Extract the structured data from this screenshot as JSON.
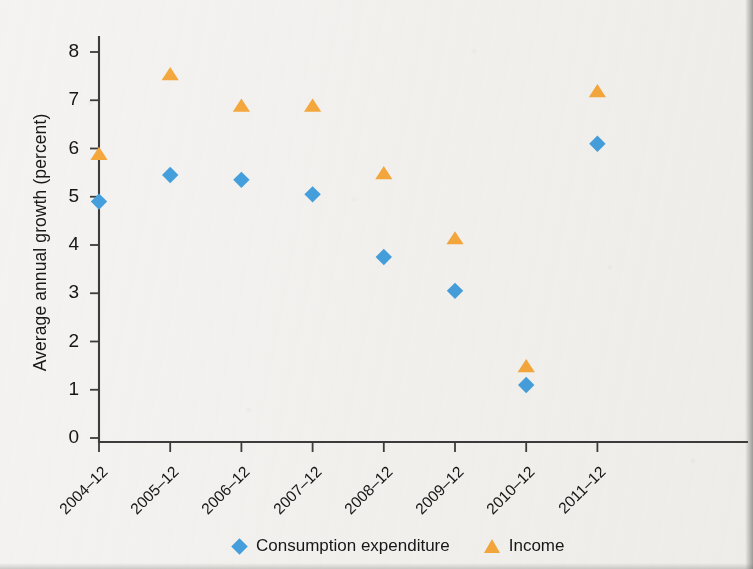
{
  "chart_data": {
    "type": "scatter",
    "title": "",
    "xlabel": "",
    "ylabel": "Average annual growth (percent)",
    "categories": [
      "2004–12",
      "2005–12",
      "2006–12",
      "2007–12",
      "2008–12",
      "2009–12",
      "2010–12",
      "2011–12"
    ],
    "ylim": [
      0,
      8
    ],
    "y_ticks": [
      0,
      1,
      2,
      3,
      4,
      5,
      6,
      7,
      8
    ],
    "y_tick_labels": [
      "0",
      "1",
      "2",
      "3",
      "4",
      "5",
      "6",
      "7",
      "8"
    ],
    "grid": false,
    "legend_position": "bottom",
    "series": [
      {
        "name": "Consumption expenditure",
        "marker": "diamond",
        "color": "#45a0de",
        "values": [
          4.9,
          5.45,
          5.35,
          5.05,
          3.75,
          3.05,
          1.1,
          6.1
        ]
      },
      {
        "name": "Income",
        "marker": "triangle",
        "color": "#f5a83c",
        "values": [
          5.9,
          7.55,
          6.9,
          6.9,
          5.5,
          4.15,
          1.5,
          7.2
        ]
      }
    ]
  },
  "axes": {
    "axis_color": "#3c3c3c",
    "text_color": "#161616"
  },
  "legend": {
    "entries": [
      {
        "label": "Consumption expenditure",
        "marker": "diamond-marker",
        "color": "#45a0de"
      },
      {
        "label": "Income",
        "marker": "triangle-marker",
        "color": "#f5a83c"
      }
    ]
  }
}
